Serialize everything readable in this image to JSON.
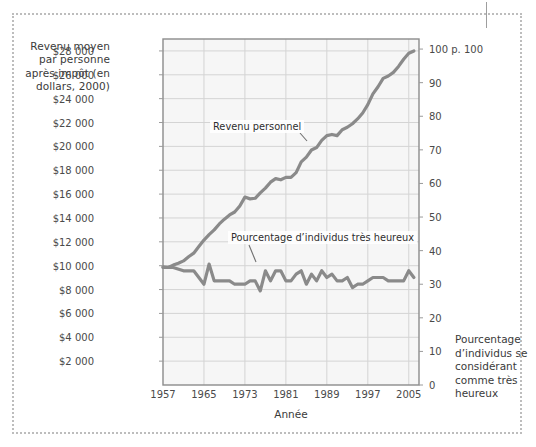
{
  "axis_titles": {
    "left": "Revenu moyen par personne après impôt (en dollars, 2000)",
    "right": "Pourcentage d’individus se considérant comme très heureux",
    "bottom": "Année"
  },
  "annotations": {
    "income": "Revenu personnel",
    "happiness": "Pourcentage d’individus très heureux"
  },
  "chart_data": {
    "type": "line",
    "title": "",
    "xlabel": "Année",
    "ylabel": "Revenu moyen par personne après impôt (en dollars, 2000)",
    "y2label": "Pourcentage d’individus se considérant comme très heureux",
    "grid": true,
    "legend": "annotations-inline",
    "xlim": [
      1957,
      2007
    ],
    "xticks": [
      1957,
      1965,
      1973,
      1981,
      1989,
      1997,
      2005
    ],
    "xtick_labels": [
      "1957",
      "1965",
      "1973",
      "1981",
      "1989",
      "1997",
      "2005"
    ],
    "ylim": [
      0,
      29000
    ],
    "yticks": [
      2000,
      4000,
      6000,
      8000,
      10000,
      12000,
      14000,
      16000,
      18000,
      20000,
      22000,
      24000,
      26000,
      28000
    ],
    "ytick_labels": [
      "$2 000",
      "$4 000",
      "$6 000",
      "$8 000",
      "$10 000",
      "$12 000",
      "$14 000",
      "$16 000",
      "$18 000",
      "$20 000",
      "$22 000",
      "$24 000",
      "$26 000",
      "$28 000"
    ],
    "y2lim": [
      0,
      103
    ],
    "y2ticks": [
      0,
      10,
      20,
      30,
      40,
      50,
      60,
      70,
      80,
      90,
      100
    ],
    "y2tick_labels": [
      "0",
      "10",
      "20",
      "30",
      "40",
      "50",
      "60",
      "70",
      "80",
      "90",
      "100 p. 100"
    ],
    "line_color": "#8a8a8a",
    "grid_color": "#d4d4d4",
    "plot_background": "#f6f6f6",
    "series": [
      {
        "name": "Revenu personnel",
        "axis": "left",
        "unit": "dollars (2000)",
        "x": [
          1957,
          1958,
          1959,
          1960,
          1961,
          1962,
          1963,
          1964,
          1965,
          1966,
          1967,
          1968,
          1969,
          1970,
          1971,
          1972,
          1973,
          1974,
          1975,
          1976,
          1977,
          1978,
          1979,
          1980,
          1981,
          1982,
          1983,
          1984,
          1985,
          1986,
          1987,
          1988,
          1989,
          1990,
          1991,
          1992,
          1993,
          1994,
          1995,
          1996,
          1997,
          1998,
          1999,
          2000,
          2001,
          2002,
          2003,
          2004,
          2005,
          2006
        ],
        "values": [
          9900,
          9850,
          10050,
          10200,
          10400,
          10750,
          11050,
          11600,
          12150,
          12600,
          13000,
          13500,
          13900,
          14250,
          14500,
          15000,
          15750,
          15600,
          15650,
          16100,
          16500,
          17000,
          17300,
          17200,
          17400,
          17400,
          17800,
          18700,
          19100,
          19700,
          19900,
          20500,
          20900,
          21000,
          20900,
          21400,
          21600,
          21900,
          22300,
          22800,
          23500,
          24400,
          25000,
          25700,
          25900,
          26200,
          26700,
          27300,
          27800,
          28000
        ]
      },
      {
        "name": "Pourcentage d’individus très heureux",
        "axis": "right",
        "unit": "pourcentage",
        "x": [
          1957,
          1959,
          1961,
          1963,
          1964,
          1965,
          1966,
          1967,
          1968,
          1969,
          1970,
          1971,
          1972,
          1973,
          1974,
          1975,
          1976,
          1977,
          1978,
          1979,
          1980,
          1981,
          1982,
          1983,
          1984,
          1985,
          1986,
          1987,
          1988,
          1989,
          1990,
          1991,
          1992,
          1993,
          1994,
          1995,
          1996,
          1997,
          1998,
          1999,
          2000,
          2001,
          2002,
          2003,
          2004,
          2005,
          2006
        ],
        "values": [
          35,
          35,
          34,
          34,
          32,
          30,
          36,
          31,
          31,
          31,
          31,
          30,
          30,
          30,
          31,
          31,
          28,
          34,
          31,
          34,
          34,
          31,
          31,
          33,
          34,
          30,
          33,
          31,
          34,
          32,
          33,
          31,
          31,
          32,
          29,
          30,
          30,
          31,
          32,
          32,
          32,
          31,
          31,
          31,
          31,
          34,
          32
        ]
      }
    ]
  }
}
